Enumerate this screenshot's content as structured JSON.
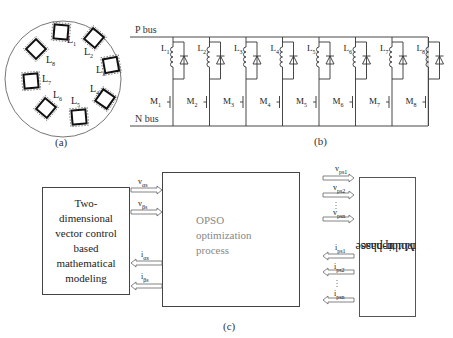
{
  "panel_a": {
    "caption": "(a)",
    "coils": [
      "L1",
      "L2",
      "L3",
      "L4",
      "L5",
      "L6",
      "L7",
      "L8"
    ]
  },
  "panel_b": {
    "caption": "(b)",
    "p_bus": "P bus",
    "n_bus": "N bus",
    "inductors": [
      "L1",
      "L2",
      "L3",
      "L4",
      "L5",
      "L6",
      "L7",
      "L8"
    ],
    "mosfets": [
      "M1",
      "M2",
      "M3",
      "M4",
      "M5",
      "M6",
      "M7",
      "M8"
    ]
  },
  "panel_c": {
    "caption": "(c)",
    "left_block": "Two-dimensional vector control based mathematical modeling",
    "left_block_lines": [
      "Two-",
      "dimensional",
      "vector control",
      "based",
      "mathematical",
      "modeling"
    ],
    "center_block_lines": [
      "OPSO",
      "optimization",
      "process"
    ],
    "motor_block_lines": [
      "n-phase",
      "Multiphase",
      "motor"
    ],
    "left_signals_in": [
      {
        "base": "v",
        "sub": "αs"
      },
      {
        "base": "v",
        "sub": "βs"
      }
    ],
    "left_signals_out": [
      {
        "base": "i",
        "sub": "αs"
      },
      {
        "base": "i",
        "sub": "βs"
      }
    ],
    "right_voltages": [
      {
        "base": "v",
        "sub": "ps1"
      },
      {
        "base": "v",
        "sub": "ps2"
      },
      {
        "base": "v",
        "sub": "psn"
      }
    ],
    "right_currents": [
      {
        "base": "i",
        "sub": "ps1"
      },
      {
        "base": "i",
        "sub": "ps2"
      },
      {
        "base": "i",
        "sub": "psn"
      }
    ]
  }
}
